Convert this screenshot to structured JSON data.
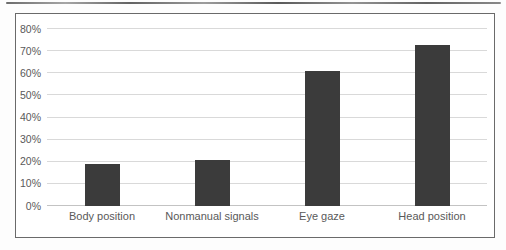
{
  "figure": {
    "background": "#ffffff",
    "border_color": "#6a6a6a",
    "has_title": false,
    "has_legend": false
  },
  "chart_data": {
    "type": "bar",
    "title": "",
    "xlabel": "",
    "ylabel": "",
    "categories": [
      "Body position",
      "Nonmanual signals",
      "Eye gaze",
      "Head position"
    ],
    "values": [
      19,
      21,
      61,
      73
    ],
    "ylim": [
      0,
      80
    ],
    "ytick_step": 10,
    "ytick_labels": [
      "0%",
      "10%",
      "20%",
      "30%",
      "40%",
      "50%",
      "60%",
      "70%",
      "80%"
    ],
    "grid": true,
    "legend_position": "none",
    "bar_color": "#3b3b3b",
    "gridline_color": "#d9d9d9",
    "axis_text_color": "#595959"
  }
}
